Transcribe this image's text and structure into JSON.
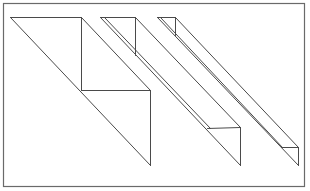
{
  "figure": {
    "stroke_color": "#4a4a4a",
    "frame_color": "#6a6a6a",
    "background": "#ffffff",
    "frame": {
      "x": 3.5,
      "y": 3.5,
      "w": 301,
      "h": 183
    },
    "shapes": [
      {
        "name": "wide-strip",
        "segments": [
          [
            10,
            17,
            81,
            17
          ],
          [
            10,
            17,
            150,
            165
          ],
          [
            81,
            17,
            81,
            90
          ],
          [
            81,
            17,
            150,
            90
          ],
          [
            81,
            90,
            150,
            90
          ],
          [
            150,
            90,
            150,
            165
          ]
        ]
      },
      {
        "name": "medium-strip",
        "segments": [
          [
            100,
            17,
            135,
            17
          ],
          [
            100,
            17,
            240,
            165
          ],
          [
            104,
            17,
            210,
            128
          ],
          [
            135,
            17,
            135,
            55
          ],
          [
            135,
            17,
            240,
            127
          ],
          [
            207,
            128,
            240,
            127
          ],
          [
            240,
            127,
            240,
            165
          ]
        ]
      },
      {
        "name": "narrow-strip",
        "segments": [
          [
            157,
            17,
            175,
            17
          ],
          [
            157,
            17,
            298,
            165
          ],
          [
            160,
            17,
            282,
            147
          ],
          [
            175,
            17,
            175,
            35
          ],
          [
            175,
            17,
            298,
            147
          ],
          [
            281,
            147,
            298,
            147
          ],
          [
            298,
            147,
            298,
            165
          ]
        ]
      }
    ]
  }
}
